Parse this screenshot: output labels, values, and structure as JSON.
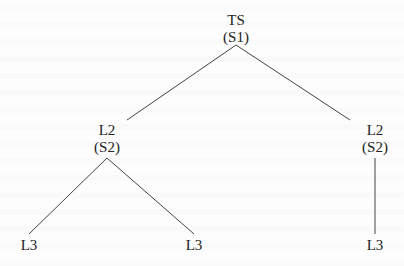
{
  "diagram": {
    "type": "tree",
    "nodes": [
      {
        "id": "root",
        "label": "TS",
        "sublabel": "(S1)"
      },
      {
        "id": "l2_left",
        "label": "L2",
        "sublabel": "(S2)"
      },
      {
        "id": "l2_right",
        "label": "L2",
        "sublabel": "(S2)"
      },
      {
        "id": "l3_a",
        "label": "L3"
      },
      {
        "id": "l3_b",
        "label": "L3"
      },
      {
        "id": "l3_c",
        "label": "L3"
      }
    ],
    "edges": [
      [
        "root",
        "l2_left"
      ],
      [
        "root",
        "l2_right"
      ],
      [
        "l2_left",
        "l3_a"
      ],
      [
        "l2_left",
        "l3_b"
      ],
      [
        "l2_right",
        "l3_c"
      ]
    ],
    "line_color": "#444444"
  }
}
